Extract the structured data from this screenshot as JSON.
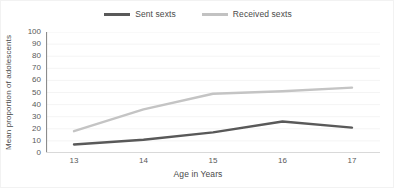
{
  "chart_data": {
    "type": "line",
    "title": "",
    "xlabel": "Age in Years",
    "ylabel": "Mean proportion of adolescents",
    "categories": [
      "13",
      "14",
      "15",
      "16",
      "17"
    ],
    "x": [
      13,
      14,
      15,
      16,
      17
    ],
    "series": [
      {
        "name": "Sent sexts",
        "values": [
          7,
          11,
          17,
          26,
          21
        ],
        "color": "#595959"
      },
      {
        "name": "Received sexts",
        "values": [
          18,
          36,
          49,
          51,
          54
        ],
        "color": "#c4c4c4"
      }
    ],
    "ylim": [
      0,
      100
    ],
    "ytick_step": 10,
    "yticks": [
      "100",
      "90",
      "80",
      "70",
      "60",
      "50",
      "40",
      "30",
      "20",
      "10",
      "0"
    ],
    "xticks": [
      "13",
      "14",
      "15",
      "16",
      "17"
    ],
    "grid": true,
    "grid_axis": "y",
    "legend_position": "top-center",
    "legend": [
      "Sent sexts",
      "Received sexts"
    ]
  },
  "legend": {
    "items": [
      {
        "label": "Sent sexts"
      },
      {
        "label": "Received sexts"
      }
    ]
  },
  "axes": {
    "y_title": "Mean proportion of adolescents",
    "x_title": "Age in Years"
  }
}
